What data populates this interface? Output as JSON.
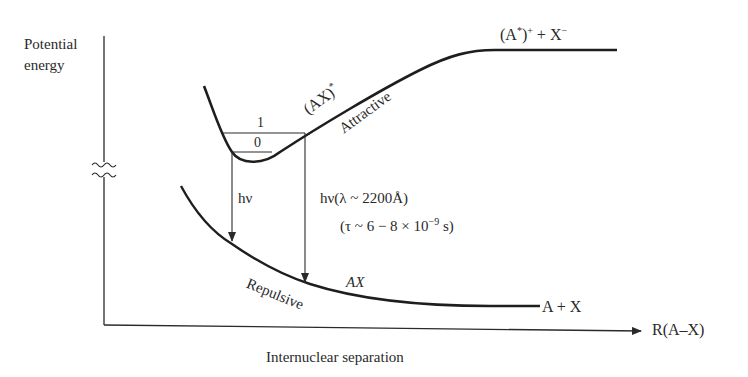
{
  "diagram": {
    "y_axis": {
      "label_line1": "Potential",
      "label_line2": "energy",
      "has_break": true
    },
    "x_axis": {
      "label": "Internuclear separation",
      "end_label": "R(A–X)"
    },
    "upper_curve": {
      "name": "(AX)*",
      "name_base": "(AX)",
      "name_sup": "*",
      "type_label": "Attractive",
      "asymptote_label": "(A*)+ + X−",
      "asymptote_parts": {
        "open": "(A",
        "star": "*",
        "close": ")",
        "plus": "+",
        "mid": " + X",
        "minus": "−"
      },
      "vibrational_levels": [
        {
          "label": "1"
        },
        {
          "label": "0"
        }
      ]
    },
    "lower_curve": {
      "name": "AX",
      "type_label": "Repulsive",
      "asymptote_label": "A + X"
    },
    "transitions": [
      {
        "label": "hν"
      },
      {
        "label_line1": "hν(λ ~ 2200Å)",
        "label_line2_pre": "(τ ~ 6 − 8 × 10",
        "label_line2_exp": "−9",
        "label_line2_post": " s)"
      }
    ],
    "colors": {
      "ink": "#2a2a2a",
      "background": "#ffffff"
    }
  }
}
